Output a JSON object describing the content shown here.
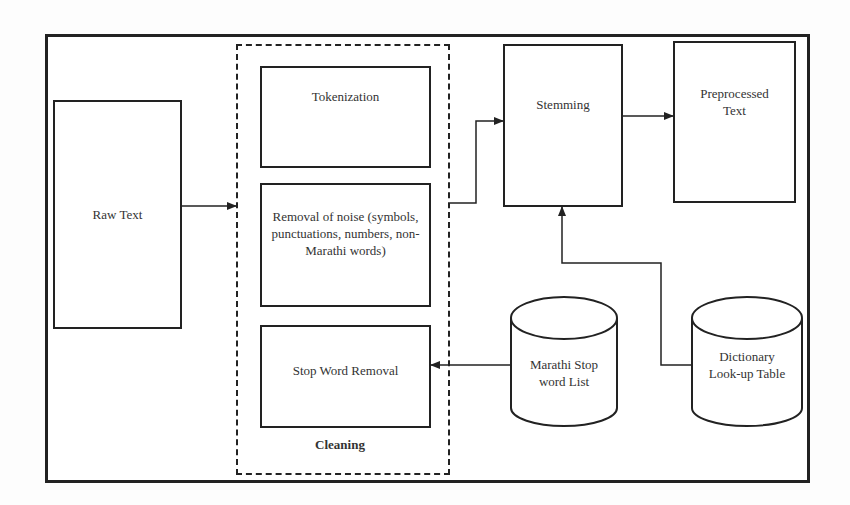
{
  "diagram": {
    "nodes": {
      "raw_text": "Raw Text",
      "tokenization": "Tokenization",
      "noise_removal": "Removal of noise (symbols, punctuations, numbers, non-Marathi words)",
      "stop_word_removal": "Stop Word Removal",
      "cleaning_group": "Cleaning",
      "stemming": "Stemming",
      "preprocessed_text": "Preprocessed Text",
      "stop_word_list": "Marathi Stop word List",
      "dictionary": "Dictionary Look-up Table"
    },
    "edges": [
      {
        "from": "Raw Text",
        "to": "Cleaning"
      },
      {
        "from": "Cleaning",
        "to": "Stemming"
      },
      {
        "from": "Stemming",
        "to": "Preprocessed Text"
      },
      {
        "from": "Marathi Stop word List",
        "to": "Stop Word Removal"
      },
      {
        "from": "Dictionary Look-up Table",
        "to": "Stemming"
      }
    ]
  }
}
